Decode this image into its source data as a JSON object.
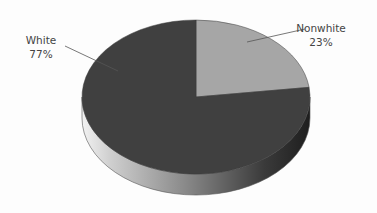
{
  "chart_data": {
    "type": "pie",
    "style": "3d",
    "title": "",
    "categories": [
      "White",
      "Nonwhite"
    ],
    "values": [
      77,
      23
    ],
    "labels": [
      {
        "name": "White",
        "value_label": "77%"
      },
      {
        "name": "Nonwhite",
        "value_label": "23%"
      }
    ],
    "colors": {
      "White": "#404040",
      "Nonwhite": "#a6a6a6"
    },
    "legend": "none",
    "data_labels": "outside with leader lines"
  },
  "labels": {
    "white_name": "White",
    "white_pct": "77%",
    "nonwhite_name": "Nonwhite",
    "nonwhite_pct": "23%"
  }
}
